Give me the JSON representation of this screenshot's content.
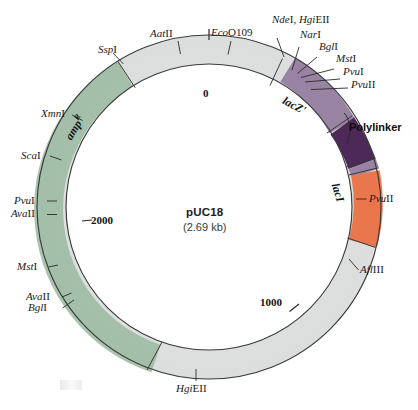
{
  "figure": {
    "plasmid_name": "pUC18",
    "plasmid_size": "(2.69 kb)",
    "type": "plasmid-map"
  },
  "colors": {
    "backbone": "#e3e5e4",
    "ampR": "#a8c4ae",
    "lacZ": "#9d87a8",
    "polylinker": "#4e2a5a",
    "lacI": "#f07a4f",
    "outline": "#3b3b3b",
    "text": "#1a1a1a"
  },
  "segments": [
    {
      "name": "ampR",
      "label": "amp",
      "superscript": "R",
      "color": "#a8c4ae"
    },
    {
      "name": "lacZ-prime",
      "label": "lacZ'",
      "color": "#9d87a8"
    },
    {
      "name": "polylinker",
      "label": "Polylinker",
      "color": "#4e2a5a"
    },
    {
      "name": "lacI",
      "label": "lacI",
      "color": "#f07a4f"
    }
  ],
  "scale_ticks": [
    {
      "value": "0",
      "position": "top"
    },
    {
      "value": "1000",
      "position": "bottom-right"
    },
    {
      "value": "2000",
      "position": "left"
    }
  ],
  "restriction_sites": {
    "top_left": [
      {
        "prefix": "Ssp",
        "suffix": "I"
      },
      {
        "prefix": "Aat",
        "suffix": "II"
      },
      {
        "prefix": "Eco",
        "suffix": "O109"
      }
    ],
    "top_right": [
      {
        "prefix": "Nde",
        "suffix": "I, ",
        "prefix2": "Hgi",
        "suffix2": "EII"
      },
      {
        "prefix": "Nar",
        "suffix": "I"
      },
      {
        "prefix": "Bgl",
        "suffix": "I"
      },
      {
        "prefix": "Mst",
        "suffix": "I"
      },
      {
        "prefix": "Pvu",
        "suffix": "I"
      },
      {
        "prefix": "Pvu",
        "suffix": "II"
      }
    ],
    "right": [
      {
        "prefix": "Pvu",
        "suffix": "II"
      },
      {
        "prefix": "Afl",
        "suffix": "III"
      }
    ],
    "left": [
      {
        "prefix": "Xmn",
        "suffix": "I"
      },
      {
        "prefix": "Sca",
        "suffix": "I"
      },
      {
        "prefix": "Pvu",
        "suffix": "I"
      },
      {
        "prefix": "Ava",
        "suffix": "II"
      },
      {
        "prefix": "Mst",
        "suffix": "I"
      },
      {
        "prefix": "Ava",
        "suffix": "II"
      },
      {
        "prefix": "Bgl",
        "suffix": "I"
      }
    ],
    "bottom": [
      {
        "prefix": "Hgi",
        "suffix": "EII"
      }
    ]
  },
  "labels": {
    "ssp1": "SspI",
    "aat2": "AatII",
    "eco0109": "EcoO109",
    "nde1_hgi": "NdeI, HgiEII",
    "nar1": "NarI",
    "bgl1_top": "BglI",
    "mst1_top": "MstI",
    "pvu1_top": "PvuI",
    "pvu2_top": "PvuII",
    "pvu2_right": "PvuII",
    "afl3": "AflIII",
    "xmn1": "XmnI",
    "sca1": "ScaI",
    "pvu1_left": "PvuI",
    "ava2_upper": "AvaII",
    "mst1_left": "MstI",
    "ava2_lower": "AvaII",
    "bgl1_left": "BglI",
    "hgi_bottom": "HgiEII",
    "polylinker": "Polylinker",
    "lacZ": "lacZ'",
    "lacI": "lacI",
    "ampR_base": "amp",
    "ampR_sup": "R",
    "tick0": "0",
    "tick1000": "1000",
    "tick2000": "2000",
    "center_name": "pUC18",
    "center_size": "(2.69 kb)"
  }
}
